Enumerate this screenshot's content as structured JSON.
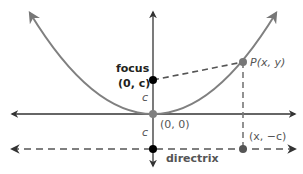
{
  "diagram": {
    "labels": {
      "focus_word": "focus",
      "focus_coord": "(0, c)",
      "vertex": "(0, 0)",
      "c_upper": "c",
      "c_lower": "c",
      "point_p": "P(x, y)",
      "directrix_point": "(x, −c)",
      "directrix": "directrix"
    },
    "colors": {
      "parabola": "#808080",
      "axes": "#333333",
      "dashed": "#555555",
      "focus_point": "#000000",
      "point": "#777777"
    }
  }
}
